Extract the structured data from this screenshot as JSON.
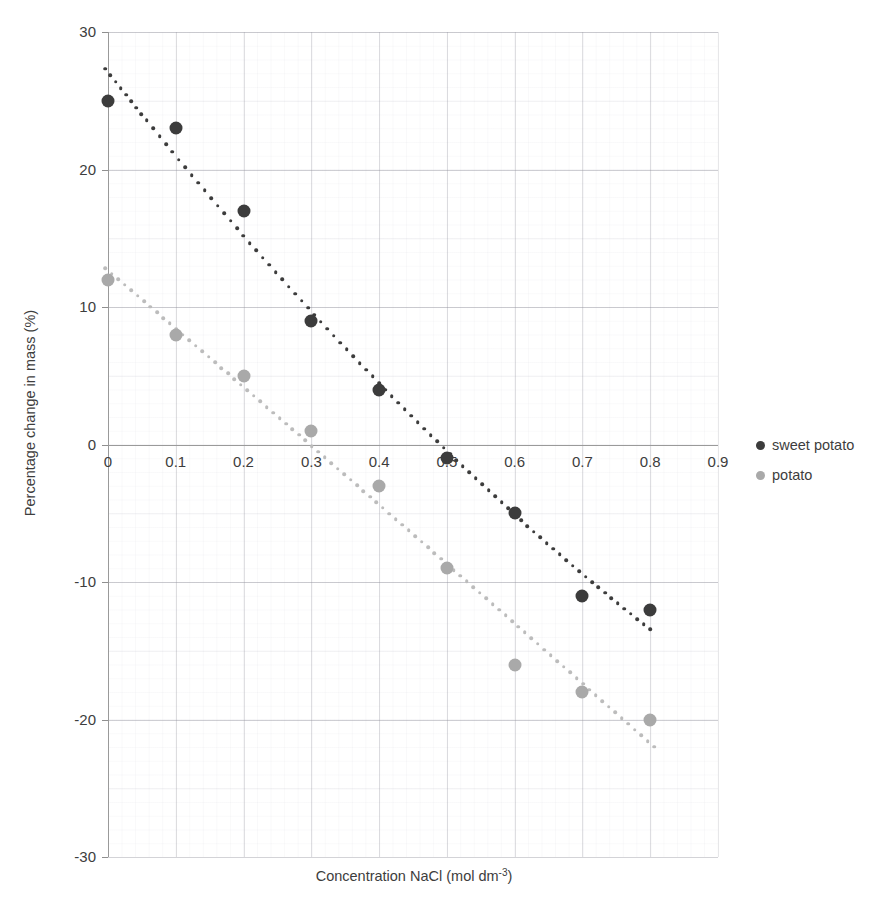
{
  "chart_data": {
    "type": "scatter",
    "title": "",
    "xlabel": "Concentration NaCl (mol dm-3)",
    "xlabel_base": "Concentration NaCl (mol dm",
    "xlabel_sup": "-3",
    "xlabel_tail": ")",
    "ylabel": "Percentage change in mass (%)",
    "xlim": [
      0,
      0.9
    ],
    "ylim": [
      -30,
      30
    ],
    "x_ticks": [
      0,
      0.1,
      0.2,
      0.3,
      0.4,
      0.5,
      0.6,
      0.7,
      0.8,
      0.9
    ],
    "x_tick_labels": [
      "0",
      "0.1",
      "0.2",
      "0.3",
      "0.4",
      "0.5",
      "0.6",
      "0.7",
      "0.8",
      "0.9"
    ],
    "y_ticks": [
      30,
      20,
      10,
      0,
      -10,
      -20,
      -30
    ],
    "y_tick_labels": [
      "30",
      "20",
      "10",
      "0",
      "-10",
      "-20",
      "-30"
    ],
    "grid": true,
    "grid_style": "graph-paper",
    "legend_position": "right",
    "x": [
      0,
      0.1,
      0.2,
      0.3,
      0.4,
      0.5,
      0.6,
      0.7,
      0.8
    ],
    "series": [
      {
        "name": "sweet potato",
        "color": "#3c3c3c",
        "trendline": "polynomial-dotted",
        "values": [
          25,
          23,
          17,
          9,
          4,
          -1,
          -5,
          -11,
          -12
        ]
      },
      {
        "name": "potato",
        "color": "#a9a9a9",
        "trendline": "polynomial-dotted",
        "values": [
          12,
          8,
          5,
          1,
          -3,
          -9,
          -16,
          -18,
          -20
        ]
      }
    ]
  },
  "legend": {
    "items": [
      {
        "label": "sweet potato"
      },
      {
        "label": "potato"
      }
    ]
  }
}
